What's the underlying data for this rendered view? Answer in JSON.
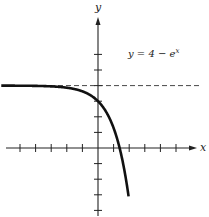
{
  "chart_data": {
    "type": "line",
    "title": "",
    "annotation": "y = 4 − e^x",
    "equation_text": "y = 4 − e",
    "equation_sup": "x",
    "xlabel": "x",
    "ylabel": "y",
    "xlim": [
      -6,
      6
    ],
    "ylim": [
      -4,
      6
    ],
    "x_ticks": [
      -5,
      -4,
      -3,
      -2,
      -1,
      1,
      2,
      3,
      4,
      5
    ],
    "y_ticks": [
      -4,
      -3,
      -2,
      -1,
      1,
      2,
      3,
      4,
      5,
      6
    ],
    "grid": false,
    "legend": "none",
    "series": [
      {
        "name": "y = 4 - e^x",
        "function": "4 - exp(x)",
        "x": [
          -6,
          -4,
          -2,
          -1,
          0,
          0.5,
          1,
          1.386,
          1.6,
          1.95
        ],
        "values": [
          3.998,
          3.98,
          3.86,
          3.63,
          3,
          2.35,
          1.28,
          0,
          -0.95,
          -3.03
        ]
      }
    ],
    "asymptote": {
      "type": "horizontal",
      "y": 4,
      "style": "dashed"
    },
    "colors": {
      "curve": "#111111",
      "axes": "#222222",
      "asymptote": "#333333"
    }
  }
}
